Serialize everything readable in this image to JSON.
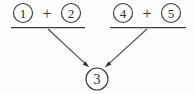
{
  "figure": {
    "title": "Circled number addition grouping diagram",
    "background_color": "#fdfdfd",
    "ink_color": "#3a3a3a",
    "width": 194,
    "height": 94
  },
  "groups": [
    {
      "id": "left-group",
      "terms": [
        {
          "label": "1",
          "display": "①",
          "cx": 23,
          "cy": 13,
          "r": 9.5
        },
        {
          "label": "2",
          "display": "②",
          "cx": 71,
          "cy": 13,
          "r": 9.5
        }
      ],
      "operator": {
        "symbol": "+",
        "name": "plus",
        "x": 47,
        "y": 13
      },
      "rule": {
        "x1": 11,
        "y1": 27.5,
        "x2": 85,
        "y2": 27.5
      }
    },
    {
      "id": "right-group",
      "terms": [
        {
          "label": "4",
          "display": "④",
          "cx": 123,
          "cy": 13,
          "r": 9.5
        },
        {
          "label": "5",
          "display": "⑤",
          "cx": 171,
          "cy": 13,
          "r": 9.5
        }
      ],
      "operator": {
        "symbol": "+",
        "name": "plus",
        "x": 147,
        "y": 13
      },
      "rule": {
        "x1": 110,
        "y1": 27.5,
        "x2": 186,
        "y2": 27.5
      }
    }
  ],
  "result": {
    "label": "3",
    "display": "③",
    "cx": 97,
    "cy": 79,
    "r": 11
  },
  "arrows": [
    {
      "id": "left-arrow",
      "from_group": "left-group",
      "x1": 48,
      "y1": 29,
      "x2": 88.5,
      "y2": 66.5,
      "head_angle_deg": 43
    },
    {
      "id": "right-arrow",
      "from_group": "right-group",
      "x1": 147,
      "y1": 29,
      "x2": 106,
      "y2": 66.5,
      "head_angle_deg": 137
    }
  ]
}
